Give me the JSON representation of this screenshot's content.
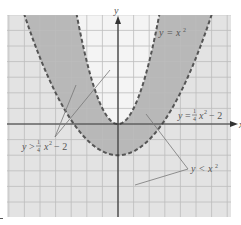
{
  "chart_data": {
    "type": "area",
    "title": "",
    "xlabel": "x",
    "ylabel": "y",
    "xlim": [
      -7.1,
      7.2
    ],
    "ylim": [
      -6.0,
      7.0
    ],
    "grid": true,
    "grid_step": 1,
    "series": [
      {
        "name": "y = x^2",
        "function": "x^2",
        "style": "dashed",
        "boundary_of": "y < x^2"
      },
      {
        "name": "y = 1/4 x^2 - 2",
        "function": "0.25*x^2 - 2",
        "style": "dashed",
        "boundary_of": "y > 1/4 x^2 - 2"
      }
    ],
    "shaded_region": "1/4 x^2 - 2 < y < x^2",
    "annotations": [
      {
        "text": "y = x²",
        "position": "upper right near curve"
      },
      {
        "text": "y = ¼x² − 2",
        "position": "right near x-axis"
      },
      {
        "text": "y > ¼x² − 2",
        "position": "lower left with two pointer lines"
      },
      {
        "text": "y < x²",
        "position": "lower right with two pointer lines"
      }
    ]
  },
  "labels": {
    "x_axis": "x",
    "y_axis": "y",
    "upper_curve": {
      "y": "y",
      "eq": "=",
      "rhs": "x",
      "exp": "2"
    },
    "lower_curve": {
      "y": "y",
      "eq": "=",
      "num": "1",
      "den": "4",
      "rhs": "x",
      "exp": "2",
      "tail": "− 2"
    },
    "ineq_lower": {
      "y": "y",
      "op": ">",
      "num": "1",
      "den": "4",
      "rhs": "x",
      "exp": "2",
      "tail": "− 2"
    },
    "ineq_upper": {
      "y": "y",
      "op": "<",
      "rhs": "x",
      "exp": "2"
    }
  },
  "colors": {
    "grid_bg": "#e3e3e3",
    "grid_line": "#bcbcbc",
    "shade": "#b8b8b8",
    "inner": "#f4f4f4",
    "curve": "#555555",
    "axis": "#333333"
  }
}
